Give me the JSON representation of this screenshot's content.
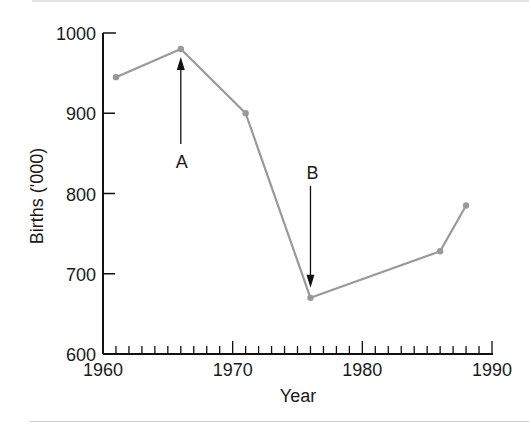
{
  "chart_data": {
    "type": "line",
    "title": "",
    "xlabel": "Year",
    "ylabel": "Births ('000)",
    "xlim": [
      1960,
      1990
    ],
    "ylim": [
      600,
      1000
    ],
    "x_ticks": [
      "1960",
      "1970",
      "1980",
      "1990"
    ],
    "y_ticks": [
      "600",
      "700",
      "800",
      "900",
      "1000"
    ],
    "grid": false,
    "legend": null,
    "series": [
      {
        "name": "Births",
        "color": "#999999",
        "x": [
          1961,
          1966,
          1971,
          1976,
          1986,
          1988
        ],
        "values": [
          945,
          980,
          900,
          670,
          728,
          785
        ]
      }
    ],
    "annotations": [
      {
        "label": "A",
        "x": 1966,
        "direction": "up",
        "points_to": 980
      },
      {
        "label": "B",
        "x": 1976,
        "direction": "down",
        "points_to": 670
      }
    ]
  }
}
